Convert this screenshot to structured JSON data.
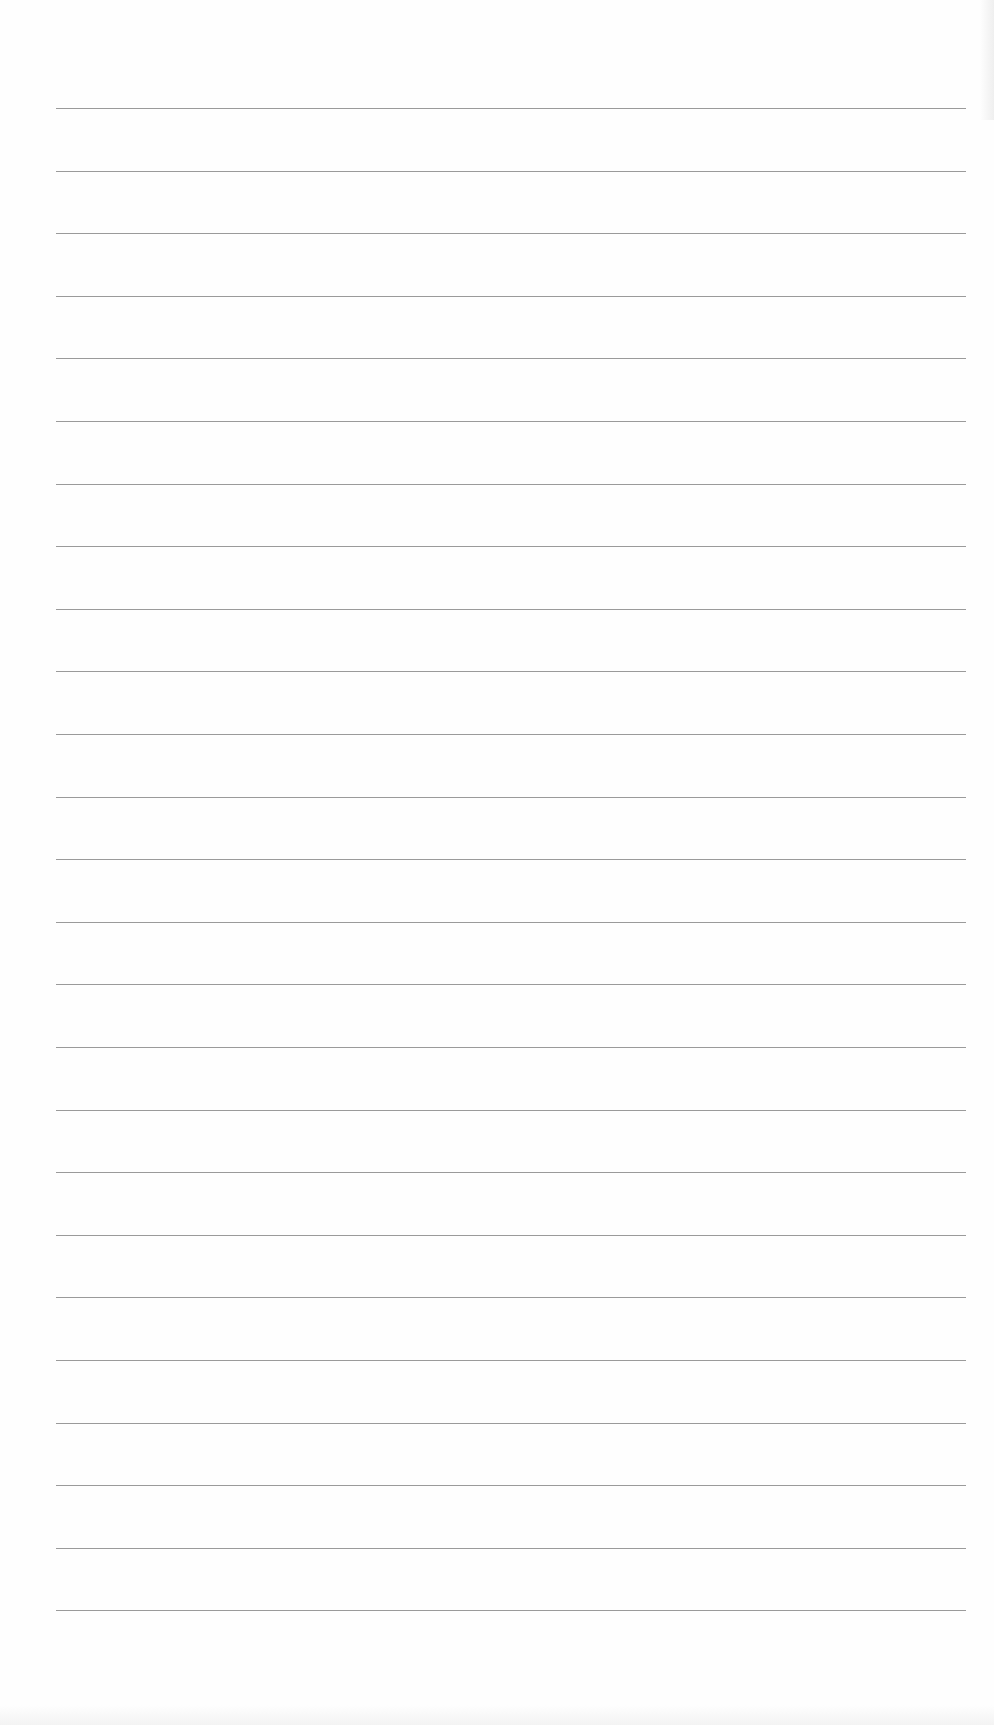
{
  "page": {
    "type": "lined-paper",
    "background_color": "#fefefe",
    "line_color": "#9a9a9a",
    "line_count": 25,
    "first_line_y": 108,
    "line_spacing": 62.6,
    "line_left_x": 56,
    "line_right_x": 966
  }
}
